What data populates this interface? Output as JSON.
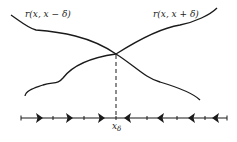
{
  "diagram": {
    "curve_left_label": "r(x, x − δ)",
    "curve_right_label": "r(x, x + δ)",
    "axis_label_main": "x",
    "axis_label_sub": "δ",
    "line_color": "#1a1a1a",
    "right_arrows_x": [
      40,
      69,
      101
    ],
    "left_arrows_x": [
      127,
      160,
      191,
      215
    ],
    "ticks_x": [
      21,
      53,
      84,
      147,
      177,
      205,
      227
    ]
  }
}
